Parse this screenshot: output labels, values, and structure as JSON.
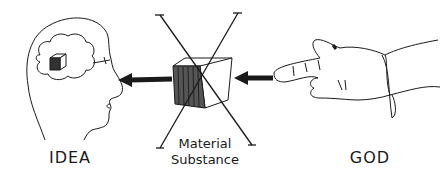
{
  "diagram": {
    "type": "conceptual-illustration",
    "labels": {
      "idea": "IDEA",
      "material_line1": "Material",
      "material_line2": "Substance",
      "god": "GOD"
    },
    "elements": [
      {
        "id": "head",
        "description": "profile of human head with thought cloud containing small cube"
      },
      {
        "id": "cube",
        "description": "cube with shaded left face, crossed out by large X"
      },
      {
        "id": "hand",
        "description": "pointing hand with sleeve"
      },
      {
        "id": "arrow-left",
        "description": "arrow from cube to head"
      },
      {
        "id": "arrow-right",
        "description": "arrow from finger to cube"
      }
    ],
    "colors": {
      "ink": "#1a1a1a",
      "background": "#ffffff"
    }
  }
}
